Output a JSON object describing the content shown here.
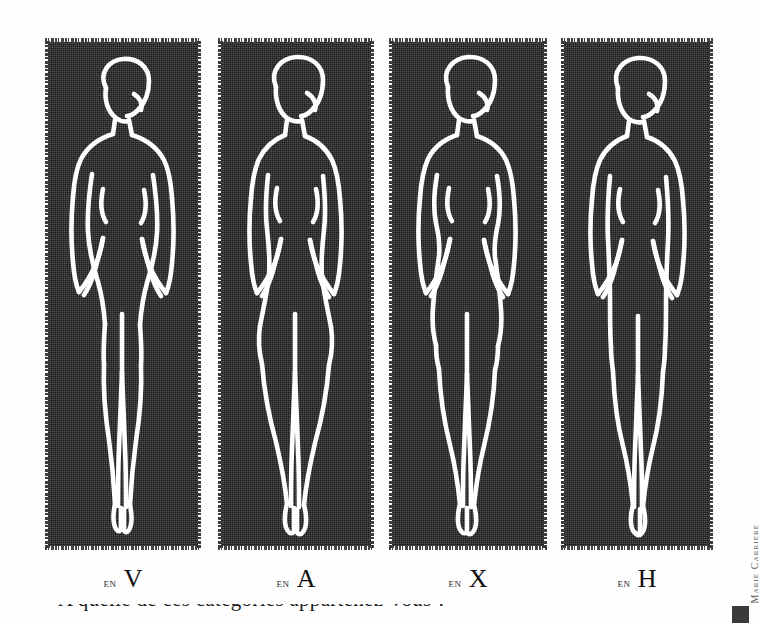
{
  "page": {
    "background_color": "#fefefe",
    "panel_color": "#3b3b3b",
    "line_color": "#ffffff",
    "caption_color": "#111111"
  },
  "illustration": {
    "title": "Les quatre silhouettes feminines",
    "credit": "Marie Carriere",
    "panel_count": 4
  },
  "figures": [
    {
      "id": "figure-v",
      "caption_prefix": "en",
      "caption_letter": "V",
      "shape_name": "V silhouette",
      "description": "shoulders wider than hips, narrow lower body"
    },
    {
      "id": "figure-a",
      "caption_prefix": "en",
      "caption_letter": "A",
      "shape_name": "A silhouette",
      "description": "hips wider than shoulders, pear shape"
    },
    {
      "id": "figure-x",
      "caption_prefix": "en",
      "caption_letter": "X",
      "shape_name": "X silhouette",
      "description": "shoulders and hips balanced, defined waist"
    },
    {
      "id": "figure-h",
      "caption_prefix": "en",
      "caption_letter": "H",
      "shape_name": "H silhouette",
      "description": "straight body line, little waist definition"
    }
  ],
  "footer": {
    "cut_off_line": "A quelle de ces categories appartenez-vous ?"
  }
}
